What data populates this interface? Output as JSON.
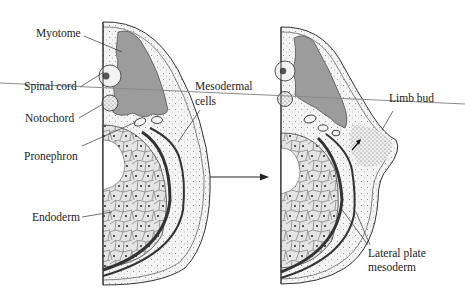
{
  "figure": {
    "left_panel": {
      "labels": {
        "myotome": "Myotome",
        "spinal_cord": "Spinal cord",
        "notochord": "Notochord",
        "pronephron": "Pronephron",
        "endoderm": "Endoderm",
        "mesodermal_cells_line1": "Mesodermal",
        "mesodermal_cells_line2": "cells"
      }
    },
    "right_panel": {
      "labels": {
        "limb_bud": "Limb bud",
        "lateral_plate_line1": "Lateral plate",
        "lateral_plate_line2": "mesoderm"
      }
    },
    "transition_arrow": "right-arrow",
    "colors": {
      "background": "#ffffff",
      "ink": "#222222",
      "myotome_fill": "#9a9a9a",
      "stipple_fill": "#eeeeee",
      "endoderm_fill": "#e2e2e2",
      "overlay_line": "#8a8a8a"
    }
  }
}
